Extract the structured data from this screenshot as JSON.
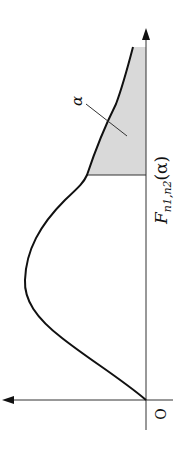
{
  "diagram": {
    "orientation": "rotated 90 degrees counter-clockwise",
    "labels": {
      "origin": "O",
      "alpha": "α",
      "critical_value_base": "F",
      "critical_value_sub": "n1,n2",
      "critical_value_arg": "(α)"
    },
    "shaded_region": {
      "meaning": "upper tail area",
      "probability_label": "α",
      "fill": "#d9d9d9"
    },
    "colors": {
      "curve": "#111111",
      "axis": "#333333",
      "shade": "#d9d9d9"
    }
  }
}
